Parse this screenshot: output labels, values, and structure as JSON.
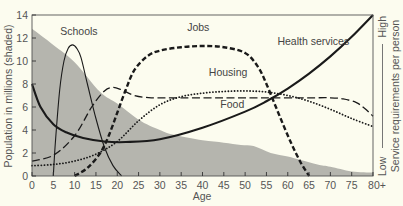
{
  "chart_data": {
    "type": "line",
    "title": "",
    "xlabel": "Age",
    "ylabel": "Population in millions (shaded)",
    "y2label": "Service requirements per person",
    "y2_low_label": "Low",
    "y2_high_label": "High",
    "xlim": [
      0,
      80
    ],
    "ylim": [
      0,
      14
    ],
    "grid": false,
    "legend_position": "inline labels",
    "x_ticks": [
      "0",
      "5",
      "10",
      "15",
      "20",
      "25",
      "30",
      "35",
      "40",
      "45",
      "50",
      "55",
      "60",
      "65",
      "70",
      "75",
      "80+"
    ],
    "y_ticks": [
      "0",
      "2",
      "4",
      "6",
      "8",
      "10",
      "12",
      "14"
    ],
    "shaded_area": {
      "name": "Population",
      "x": [
        0,
        5,
        10,
        16,
        20,
        25,
        30,
        33,
        40,
        45,
        49,
        52,
        56,
        60,
        63,
        67,
        70,
        75,
        80
      ],
      "values": [
        12.8,
        11.4,
        9.9,
        7.3,
        6.3,
        4.9,
        4.0,
        3.6,
        3.1,
        2.9,
        2.7,
        2.6,
        2.0,
        1.7,
        1.4,
        1.0,
        0.8,
        0.4,
        0.3
      ]
    },
    "series": [
      {
        "name": "Schools",
        "style": "thin solid",
        "x": [
          5,
          5.5,
          6.5,
          7.5,
          8.5,
          9.5,
          10.5,
          11.5,
          13,
          15,
          17,
          19,
          21
        ],
        "values": [
          0,
          3.0,
          7.5,
          10.0,
          11.1,
          11.4,
          11.1,
          10.3,
          8.0,
          5.0,
          2.5,
          0.9,
          0
        ]
      },
      {
        "name": "Jobs",
        "style": "heavy dash",
        "x": [
          10,
          13,
          16,
          18,
          20,
          22,
          24,
          27,
          30,
          35,
          40,
          45,
          50,
          53,
          55,
          57,
          59,
          61,
          63,
          65
        ],
        "values": [
          0,
          0.7,
          2.0,
          3.5,
          5.5,
          7.5,
          9.2,
          10.4,
          10.9,
          11.2,
          11.3,
          11.2,
          10.7,
          9.5,
          8.0,
          6.2,
          4.4,
          2.7,
          1.2,
          0
        ]
      },
      {
        "name": "Health services",
        "style": "thick solid",
        "x": [
          0,
          2,
          5,
          8,
          12,
          17,
          22,
          30,
          40,
          50,
          55,
          60,
          65,
          70,
          75,
          80
        ],
        "values": [
          8.0,
          6.0,
          4.5,
          3.8,
          3.3,
          3.0,
          2.95,
          3.2,
          4.2,
          5.6,
          6.5,
          7.6,
          8.9,
          10.4,
          12.1,
          14.0
        ]
      },
      {
        "name": "Housing",
        "style": "dotted",
        "x": [
          0,
          5,
          10,
          15,
          20,
          25,
          30,
          35,
          40,
          45,
          50,
          55,
          60,
          65,
          70,
          75,
          80
        ],
        "values": [
          0.9,
          1.0,
          1.3,
          1.9,
          3.0,
          4.8,
          6.2,
          6.9,
          7.2,
          7.35,
          7.4,
          7.3,
          7.0,
          6.5,
          5.8,
          5.0,
          4.3
        ]
      },
      {
        "name": "Food",
        "style": "long dash",
        "x": [
          0,
          5,
          10,
          14,
          17,
          19,
          21,
          24,
          28,
          35,
          45,
          55,
          65,
          70,
          73,
          76,
          78,
          80
        ],
        "values": [
          1.3,
          1.8,
          3.5,
          6.0,
          7.4,
          7.7,
          7.5,
          7.0,
          6.8,
          6.8,
          6.8,
          6.8,
          6.8,
          6.8,
          6.7,
          6.4,
          5.9,
          5.2
        ]
      }
    ],
    "annotations": [
      {
        "text": "Schools",
        "near_x": 11,
        "near_y": 12.3
      },
      {
        "text": "Jobs",
        "near_x": 39,
        "near_y": 12.6
      },
      {
        "text": "Health services",
        "near_x": 66,
        "near_y": 11.4
      },
      {
        "text": "Housing",
        "near_x": 46,
        "near_y": 8.7
      },
      {
        "text": "Food",
        "near_x": 47,
        "near_y": 5.9
      }
    ]
  },
  "colors": {
    "background": "#fcfcef",
    "shaded": "#b5b5ae",
    "lines": "#1a1a1a",
    "text": "#555555"
  }
}
